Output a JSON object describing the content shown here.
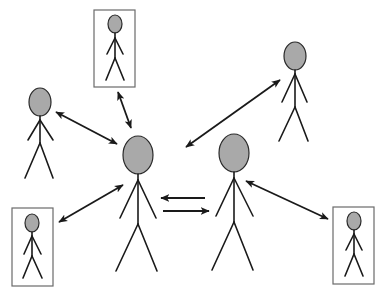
{
  "diagram": {
    "title": "",
    "colors": {
      "head_fill": "#a9a9a9",
      "line": "#1a1a1a",
      "frame": "#6a6a6a",
      "background": "#ffffff"
    },
    "figures": [
      {
        "id": "central-person-a",
        "framed": false,
        "size": "large"
      },
      {
        "id": "central-person-b",
        "framed": false,
        "size": "large"
      },
      {
        "id": "left-person",
        "framed": false,
        "size": "medium"
      },
      {
        "id": "top-right-person",
        "framed": false,
        "size": "medium"
      },
      {
        "id": "top-framed-person",
        "framed": true,
        "size": "small"
      },
      {
        "id": "bottom-left-framed-person",
        "framed": true,
        "size": "small"
      },
      {
        "id": "bottom-right-framed-person",
        "framed": true,
        "size": "small"
      }
    ],
    "connections": [
      {
        "from": "central-person-a",
        "to": "top-framed-person",
        "type": "bidirectional"
      },
      {
        "from": "central-person-a",
        "to": "left-person",
        "type": "bidirectional"
      },
      {
        "from": "central-person-a",
        "to": "bottom-left-framed-person",
        "type": "bidirectional"
      },
      {
        "from": "central-person-a",
        "to": "central-person-b",
        "type": "two-way-parallel"
      },
      {
        "from": "central-person-b",
        "to": "top-right-person",
        "type": "bidirectional",
        "note": "arrow points toward center near person A"
      },
      {
        "from": "central-person-b",
        "to": "bottom-right-framed-person",
        "type": "bidirectional"
      }
    ]
  }
}
